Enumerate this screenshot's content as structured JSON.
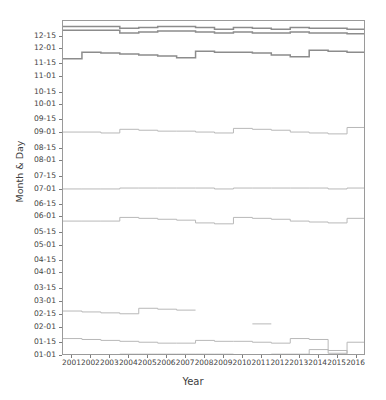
{
  "chart": {
    "title": "",
    "xlabel": "Year",
    "ylabel": "Month & Day"
  },
  "chart_data": {
    "type": "line",
    "title": "",
    "xlabel": "Year",
    "ylabel": "Month & Day",
    "grid": false,
    "legend": "none",
    "xlim": [
      2000.5,
      2016.5
    ],
    "ylim_doy": [
      1,
      366
    ],
    "x_tick_labels": [
      "2001",
      "2002",
      "2003",
      "2004",
      "2005",
      "2006",
      "2007",
      "2008",
      "2009",
      "2010",
      "2011",
      "2012",
      "2013",
      "2014",
      "2015",
      "2016"
    ],
    "y_tick_labels": [
      "01-01",
      "01-15",
      "02-01",
      "02-15",
      "03-01",
      "03-15",
      "04-01",
      "04-15",
      "05-01",
      "05-15",
      "06-01",
      "06-15",
      "07-01",
      "07-15",
      "08-01",
      "08-15",
      "09-01",
      "09-15",
      "10-01",
      "10-15",
      "11-01",
      "11-15",
      "12-01",
      "12-15"
    ],
    "y_tick_doy": [
      1,
      15,
      32,
      46,
      60,
      74,
      91,
      105,
      121,
      135,
      152,
      166,
      182,
      196,
      213,
      227,
      244,
      258,
      274,
      288,
      305,
      319,
      335,
      349
    ],
    "x": [
      2001,
      2002,
      2003,
      2004,
      2005,
      2006,
      2007,
      2008,
      2009,
      2010,
      2011,
      2012,
      2013,
      2014,
      2015,
      2016
    ],
    "series": [
      {
        "name": "series-1-late-december-upper",
        "style": "step",
        "values": [
          360,
          360,
          360,
          358,
          359,
          360,
          360,
          359,
          357,
          359,
          358,
          357,
          359,
          358,
          358,
          357
        ]
      },
      {
        "name": "series-2-late-december-lower",
        "style": "step",
        "values": [
          356,
          356,
          356,
          353,
          354,
          355,
          355,
          354,
          353,
          354,
          353,
          353,
          354,
          353,
          353,
          352
        ]
      },
      {
        "name": "series-3-late-november",
        "style": "step",
        "values": [
          325,
          332,
          331,
          330,
          329,
          328,
          326,
          333,
          332,
          332,
          331,
          329,
          327,
          334,
          333,
          332
        ]
      },
      {
        "name": "series-4-early-september",
        "style": "step",
        "values": [
          245,
          245,
          244,
          248,
          247,
          246,
          246,
          245,
          244,
          249,
          248,
          247,
          245,
          244,
          243,
          250
        ]
      },
      {
        "name": "series-5-early-july",
        "style": "step",
        "values": [
          183,
          183,
          183,
          184,
          184,
          184,
          184,
          184,
          183,
          184,
          184,
          184,
          184,
          184,
          183,
          184
        ]
      },
      {
        "name": "series-6-late-may",
        "style": "step",
        "values": [
          148,
          148,
          148,
          152,
          151,
          150,
          149,
          146,
          145,
          152,
          151,
          150,
          148,
          147,
          146,
          151
        ]
      },
      {
        "name": "series-7-mid-february",
        "style": "step",
        "values": [
          50,
          49,
          48,
          47,
          53,
          52,
          51,
          null,
          null,
          null,
          36,
          null,
          null,
          null,
          null,
          null
        ]
      },
      {
        "name": "series-8-mid-january",
        "style": "step",
        "values": [
          20,
          19,
          18,
          17,
          16,
          15,
          15,
          18,
          17,
          17,
          16,
          15,
          20,
          19,
          4,
          16
        ]
      },
      {
        "name": "series-9-new-year",
        "style": "step",
        "values": [
          2,
          2,
          2,
          3,
          3,
          3,
          3,
          3,
          3,
          2,
          2,
          3,
          3,
          8,
          7,
          2
        ]
      }
    ]
  },
  "colors": {
    "axis": "#7d7d7d",
    "frame": "#9a9a9a",
    "line_dark": "#8c8c8c",
    "line_light": "#b8b8b8",
    "text": "#434343"
  }
}
